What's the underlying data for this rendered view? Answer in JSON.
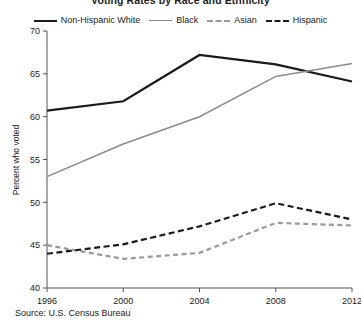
{
  "title": "Voting Rates by Race and Ethnicity",
  "source_note": "Source: U.S. Census Bureau",
  "axis": {
    "ylabel": "Percent who voted",
    "xlabel": "",
    "yticks": [
      "40",
      "45",
      "50",
      "55",
      "60",
      "65",
      "70"
    ],
    "xticks": [
      "1996",
      "2000",
      "2004",
      "2008",
      "2012"
    ]
  },
  "legend": {
    "position": "top",
    "items": [
      {
        "label": "Non-Hispanic White",
        "color": "#1a1a1a",
        "style": "solid",
        "width": 2.2
      },
      {
        "label": "Black",
        "color": "#8c8c8c",
        "style": "solid",
        "width": 1.6
      },
      {
        "label": "Asian",
        "color": "#9a9a9a",
        "style": "dashed",
        "width": 2.0
      },
      {
        "label": "Hispanic",
        "color": "#1a1a1a",
        "style": "dashed",
        "width": 2.2
      }
    ]
  },
  "chart_data": {
    "type": "line",
    "title": "Voting Rates by Race and Ethnicity",
    "xlabel": "",
    "ylabel": "Percent who voted",
    "categories": [
      "1996",
      "2000",
      "2004",
      "2008",
      "2012"
    ],
    "x": [
      1996,
      2000,
      2004,
      2008,
      2012
    ],
    "ylim": [
      40,
      70
    ],
    "yticks": [
      40,
      45,
      50,
      55,
      60,
      65,
      70
    ],
    "grid": false,
    "legend_position": "top",
    "series": [
      {
        "name": "Non-Hispanic White",
        "color": "#1a1a1a",
        "style": "solid",
        "values": [
          60.7,
          61.8,
          67.2,
          66.1,
          64.1
        ]
      },
      {
        "name": "Black",
        "color": "#8c8c8c",
        "style": "solid",
        "values": [
          53.0,
          56.8,
          60.0,
          64.7,
          66.2
        ]
      },
      {
        "name": "Asian",
        "color": "#9a9a9a",
        "style": "dashed",
        "values": [
          45.0,
          43.4,
          44.1,
          47.6,
          47.3
        ]
      },
      {
        "name": "Hispanic",
        "color": "#1a1a1a",
        "style": "dashed",
        "values": [
          44.0,
          45.1,
          47.2,
          49.9,
          48.0
        ]
      }
    ]
  }
}
